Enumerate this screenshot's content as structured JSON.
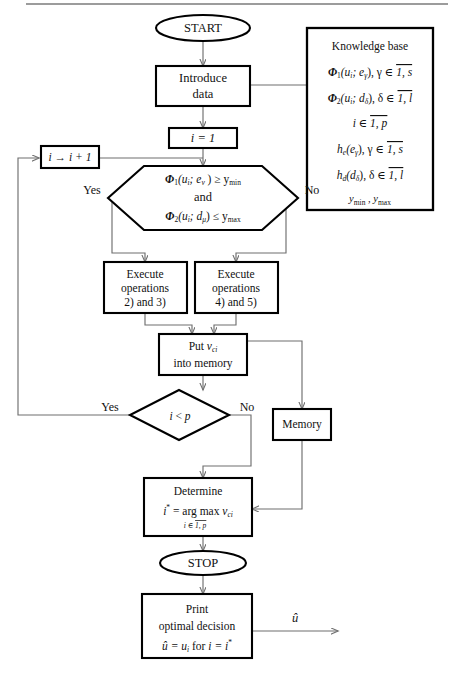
{
  "diagram": {
    "type": "flowchart"
  },
  "nodes": {
    "start": {
      "label": "START",
      "shape": "ellipse"
    },
    "introduce_data": {
      "line1": "Introduce",
      "line2": "data",
      "shape": "rect"
    },
    "init_i": {
      "label": "i = 1",
      "shape": "rect"
    },
    "increment_i": {
      "label": "i → i + 1",
      "shape": "rect"
    },
    "decision_main": {
      "line1_pre": "Φ",
      "line1_sub": "1",
      "line1_post": "(u",
      "line1_arg_sub": "i",
      "line1_rest": "; e",
      "line1_rest_sub": "ν",
      "line1_tail": " ) ≥ y",
      "line1_tail_sub": "min",
      "line2": "and",
      "line3_pre": "Φ",
      "line3_sub": "2",
      "line3_post": "(u",
      "line3_arg_sub": "i",
      "line3_rest": "; d",
      "line3_rest_sub": "μ",
      "line3_tail": ") ≤ y",
      "line3_tail_sub": "max",
      "shape": "hexagon",
      "yes_label": "Yes",
      "no_label": "No"
    },
    "exec_left": {
      "line1": "Execute",
      "line2": "operations",
      "line3": "2) and 3)",
      "shape": "rect"
    },
    "exec_right": {
      "line1": "Execute",
      "line2": "operations",
      "line3": "4) and 5)",
      "shape": "rect"
    },
    "put_memory": {
      "line1_a": "Put",
      "line1_b": "v",
      "line1_sub": "ci",
      "line2": "into memory",
      "shape": "rect"
    },
    "decision_loop": {
      "label_a": "i",
      "label_b": " < ",
      "label_c": "p",
      "shape": "diamond",
      "yes_label": "Yes",
      "no_label": "No"
    },
    "memory": {
      "label": "Memory",
      "shape": "rect"
    },
    "determine": {
      "line1": "Determine",
      "line2_a": "i",
      "line2_star": "*",
      "line2_b": " = arg max ",
      "line2_c": "v",
      "line2_c_sub": "ci",
      "line3_a": "i",
      "line3_b": " ∈ ",
      "line3_c": "1, p",
      "shape": "rect"
    },
    "stop": {
      "label": "STOP",
      "shape": "ellipse"
    },
    "print": {
      "line1": "Print",
      "line2": "optimal decision",
      "line3_a": "û",
      "line3_b": " = u",
      "line3_sub": "i",
      "line3_c": "  for  ",
      "line3_d": "i",
      "line3_e": " = i",
      "line3_star": "*",
      "shape": "rect"
    },
    "output_u": {
      "label": "û"
    }
  },
  "knowledge_base": {
    "title": "Knowledge  base",
    "lines": [
      {
        "sym": "Φ",
        "sym_sub": "1",
        "body": "(u",
        "body_sub": "i",
        "body2": "; e",
        "body2_sub": "γ",
        "tail": "), γ ∈ ",
        "range": "1, s"
      },
      {
        "sym": "Φ",
        "sym_sub": "2",
        "body": "(u",
        "body_sub": "i",
        "body2": "; d",
        "body2_sub": "δ",
        "tail": "), δ ∈ ",
        "range": "1, l"
      },
      {
        "sym": "",
        "sym_sub": "",
        "body": "i",
        "body_sub": "",
        "body2": "",
        "body2_sub": "",
        "tail": " ∈ ",
        "range": "1, p"
      },
      {
        "sym": "h",
        "sym_sub": "e",
        "body": "(e",
        "body_sub": "γ",
        "body2": "",
        "body2_sub": "",
        "tail": "),  γ ∈ ",
        "range": "1, s"
      },
      {
        "sym": "h",
        "sym_sub": "d",
        "body": "(d",
        "body_sub": "δ",
        "body2": "",
        "body2_sub": "",
        "tail": "),  δ ∈ ",
        "range": "1, l"
      }
    ],
    "last_line_a": "y",
    "last_line_a_sub": "min",
    "last_line_mid": " , ",
    "last_line_b": "y",
    "last_line_b_sub": "max"
  },
  "colors": {
    "shape_stroke": "#000000",
    "connector": "#6f6f6f",
    "text": "#111111",
    "background": "#ffffff"
  }
}
